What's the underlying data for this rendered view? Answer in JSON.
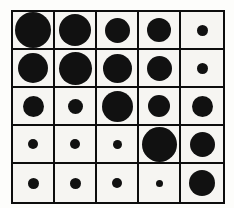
{
  "canvas": {
    "width": 234,
    "height": 208,
    "background": "#fdfdfb"
  },
  "matrix": {
    "left": 11,
    "top": 10,
    "width": 214,
    "height": 194,
    "line_color": "#0d0d0d",
    "cell_background": "#f6f5f2"
  },
  "chart_data": {
    "type": "heatmap",
    "subtype": "bubble-matrix",
    "encoding": "circle-diameter-px",
    "title": "",
    "xlabel": "",
    "ylabel": "",
    "legend": "none",
    "grid": "on",
    "rows": 5,
    "cols": 5,
    "row_labels": [
      "row-1",
      "row-2",
      "row-3",
      "row-4",
      "row-5"
    ],
    "col_labels": [
      "col-1",
      "col-2",
      "col-3",
      "col-4",
      "col-5"
    ],
    "values": [
      [
        36,
        32,
        25,
        24,
        11
      ],
      [
        30,
        33,
        29,
        25,
        11
      ],
      [
        21,
        15,
        31,
        22,
        21
      ],
      [
        10,
        10,
        9,
        35,
        25
      ],
      [
        11,
        11,
        10,
        7,
        26
      ]
    ],
    "value_range": [
      7,
      36
    ],
    "dot_color": "#111111"
  }
}
